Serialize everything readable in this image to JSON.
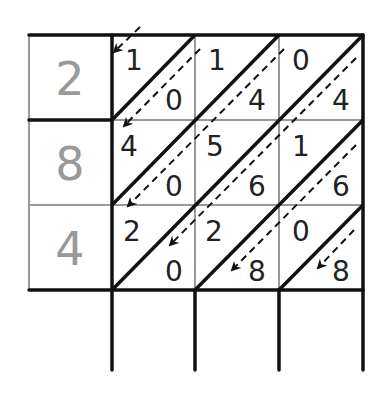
{
  "diagram": {
    "type": "lattice-multiplication",
    "multiplier_digits": [
      "2",
      "8",
      "4"
    ],
    "cells": [
      [
        {
          "tens": "1",
          "ones": "0"
        },
        {
          "tens": "1",
          "ones": "4"
        },
        {
          "tens": "0",
          "ones": "4"
        }
      ],
      [
        {
          "tens": "4",
          "ones": "0"
        },
        {
          "tens": "5",
          "ones": "6"
        },
        {
          "tens": "1",
          "ones": "6"
        }
      ],
      [
        {
          "tens": "2",
          "ones": "0"
        },
        {
          "tens": "2",
          "ones": "8"
        },
        {
          "tens": "0",
          "ones": "8"
        }
      ]
    ],
    "result_row": [
      "",
      "",
      ""
    ],
    "colors": {
      "grid_thick": "#111111",
      "grid_thin": "#999999",
      "multiplier_text": "#999999",
      "digit_text": "#222222"
    }
  }
}
